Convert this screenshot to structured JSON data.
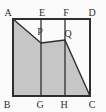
{
  "figure": {
    "colors": {
      "background": "#fbfbfb",
      "shade_fill": "#c6c6c6",
      "line": "#2f2f2f"
    },
    "shaded_region": {
      "points": "13,19 41,43 65,40 90,96 13,96"
    },
    "square": {
      "x": "13",
      "y": "19",
      "w": "77",
      "h": "77"
    },
    "segment_eg": {
      "x1": "41",
      "y1": "19",
      "x2": "41",
      "y2": "96"
    },
    "segment_fh": {
      "x1": "65",
      "y1": "19",
      "x2": "65",
      "y2": "96"
    },
    "labels": [
      {
        "text": "A",
        "x": "8",
        "y": "16"
      },
      {
        "text": "E",
        "x": "42",
        "y": "16"
      },
      {
        "text": "F",
        "x": "66",
        "y": "16"
      },
      {
        "text": "D",
        "x": "92",
        "y": "16"
      },
      {
        "text": "B",
        "x": "7",
        "y": "108"
      },
      {
        "text": "G",
        "x": "40",
        "y": "108"
      },
      {
        "text": "H",
        "x": "64",
        "y": "108"
      },
      {
        "text": "C",
        "x": "92",
        "y": "108"
      },
      {
        "text": "P",
        "x": "40",
        "y": "35"
      },
      {
        "text": "Q",
        "x": "68",
        "y": "37"
      }
    ]
  }
}
